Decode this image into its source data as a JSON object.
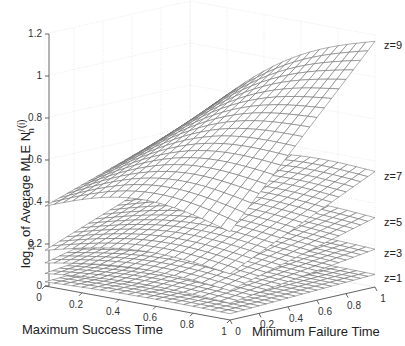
{
  "chart_data": {
    "type": "surface3d",
    "title": "",
    "xlabel": "Maximum Success Time",
    "ylabel": "Minimum Failure Time",
    "zlabel_parts": {
      "prefix": "log",
      "sub": "10",
      "mid": " of Average MLE N",
      "sup": "/",
      "sub2": "n",
      "suffix": "(i)"
    },
    "zlabel": "log10 of Average MLE N_n^/(i)",
    "xlim": [
      0,
      1
    ],
    "ylim": [
      0,
      1
    ],
    "zlim": [
      0,
      1.2
    ],
    "x_ticks": [
      {
        "value": 0,
        "label": "0"
      },
      {
        "value": 0.2,
        "label": "0.2"
      },
      {
        "value": 0.4,
        "label": "0.4"
      },
      {
        "value": 0.6,
        "label": "0.6"
      },
      {
        "value": 0.8,
        "label": "0.8"
      },
      {
        "value": 1,
        "label": "1"
      }
    ],
    "y_ticks": [
      {
        "value": 0,
        "label": "0"
      },
      {
        "value": 0.2,
        "label": "0.2"
      },
      {
        "value": 0.4,
        "label": "0.4"
      },
      {
        "value": 0.6,
        "label": "0.6"
      },
      {
        "value": 0.8,
        "label": "0.8"
      },
      {
        "value": 1,
        "label": "1"
      }
    ],
    "z_ticks": [
      {
        "value": 0,
        "label": "0"
      },
      {
        "value": 0.2,
        "label": "0.2"
      },
      {
        "value": 0.4,
        "label": "0.4"
      },
      {
        "value": 0.6,
        "label": "0.6"
      },
      {
        "value": 0.8,
        "label": "0.8"
      },
      {
        "value": 1,
        "label": "1"
      },
      {
        "value": 1.2,
        "label": "1.2"
      }
    ],
    "grid": true,
    "mesh_resolution": 20,
    "series": [
      {
        "name": "z=1",
        "corner_values": {
          "x0y0": 0.02,
          "x1y0": 0.03,
          "x0y1": 0.05,
          "x1y1": 0.06
        },
        "curvature": 0.01
      },
      {
        "name": "z=3",
        "corner_values": {
          "x0y0": 0.06,
          "x1y0": 0.08,
          "x0y1": 0.15,
          "x1y1": 0.18
        },
        "curvature": 0.03
      },
      {
        "name": "z=5",
        "corner_values": {
          "x0y0": 0.11,
          "x1y0": 0.14,
          "x0y1": 0.28,
          "x1y1": 0.33
        },
        "curvature": 0.05
      },
      {
        "name": "z=7",
        "corner_values": {
          "x0y0": 0.17,
          "x1y0": 0.22,
          "x0y1": 0.44,
          "x1y1": 0.55
        },
        "curvature": 0.07
      },
      {
        "name": "z=9",
        "corner_values": {
          "x0y0": 0.38,
          "x1y0": 0.42,
          "x0y1": 0.62,
          "x1y1": 1.17
        },
        "curvature": 0.12
      }
    ]
  },
  "colors": {
    "mesh_edge": "#666666",
    "mesh_face": "#ffffff",
    "axis": "#555555",
    "grid": "#e4e4e4",
    "text": "#222222"
  }
}
